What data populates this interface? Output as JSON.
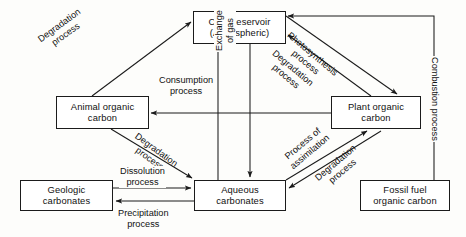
{
  "diagram": {
    "colors": {
      "background": "#fdfdfb",
      "stroke": "#1b1b1b",
      "text": "#111111",
      "node_fill": "#ffffff"
    },
    "nodes": [
      {
        "id": "co2-reservoir",
        "line1": "CO",
        "sub": "2",
        "line1b": " Reservoir",
        "line2": "(Atmospheric)",
        "x": 193,
        "y": 11,
        "w": 93,
        "h": 33
      },
      {
        "id": "animal-organic",
        "line1": "Animal organic",
        "line2": "carbon",
        "x": 56,
        "y": 96,
        "w": 93,
        "h": 33
      },
      {
        "id": "plant-organic",
        "line1": "Plant organic",
        "line2": "carbon",
        "x": 331,
        "y": 96,
        "w": 90,
        "h": 33
      },
      {
        "id": "geologic",
        "line1": "Geologic",
        "line2": "carbonates",
        "x": 20,
        "y": 180,
        "w": 93,
        "h": 31
      },
      {
        "id": "aqueous",
        "line1": "Aqueous",
        "line2": "carbonates",
        "x": 194,
        "y": 180,
        "w": 92,
        "h": 31
      },
      {
        "id": "fossil-fuel",
        "line1": "Fossil fuel",
        "line2": "organic carbon",
        "x": 360,
        "y": 180,
        "w": 90,
        "h": 31
      }
    ],
    "edges": [
      {
        "id": "degradation-animal-to-co2",
        "label_line1": "Degradation",
        "label_line2": "process",
        "from": "animal-organic",
        "to": "co2-reservoir"
      },
      {
        "id": "consumption-plant-to-animal",
        "label_line1": "Consumption",
        "label_line2": "process",
        "from": "plant-organic",
        "to": "animal-organic"
      },
      {
        "id": "exchange-of-gas",
        "label_line1": "Exchange",
        "label_line2": "of gas",
        "from": "aqueous",
        "to": "co2-reservoir"
      },
      {
        "id": "photosynthesis-co2-to-plant",
        "label_line1": "Photosynthesis",
        "label_line2": "process",
        "from": "co2-reservoir",
        "to": "plant-organic"
      },
      {
        "id": "degradation-plant-to-co2",
        "label_line1": "Degradation",
        "label_line2": "process",
        "from": "plant-organic",
        "to": "co2-reservoir"
      },
      {
        "id": "combustion-fossil-to-co2",
        "label_line1": "Combustion",
        "label_line2": "process",
        "from": "fossil-fuel",
        "to": "co2-reservoir"
      },
      {
        "id": "degradation-animal-to-aqueous",
        "label_line1": "Degradation",
        "label_line2": "process",
        "from": "animal-organic",
        "to": "aqueous"
      },
      {
        "id": "dissolution-geologic-to-aq",
        "label_line1": "Dissolution",
        "label_line2": "process",
        "from": "geologic",
        "to": "aqueous"
      },
      {
        "id": "precipitation-aq-to-geologic",
        "label_line1": "Precipitation",
        "label_line2": "process",
        "from": "aqueous",
        "to": "geologic"
      },
      {
        "id": "assimilation-aq-to-plant",
        "label_line1": "Process of",
        "label_line2": "assimilation",
        "from": "aqueous",
        "to": "plant-organic"
      },
      {
        "id": "degradation-plant-to-aqueous",
        "label_line1": "Degradation",
        "label_line2": "process",
        "from": "plant-organic",
        "to": "aqueous"
      }
    ]
  }
}
